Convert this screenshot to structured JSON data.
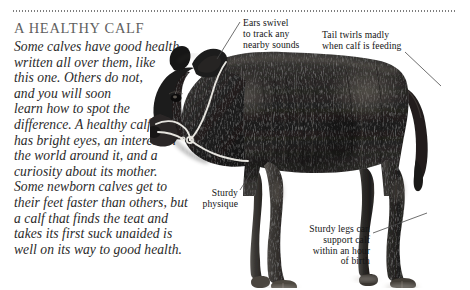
{
  "page": {
    "title": "A HEALTHY CALF",
    "body_lines": [
      "Some calves have good health",
      "written all over them, like",
      "this one. Others do not,",
      "and you will soon",
      "learn how to spot the",
      "difference. A healthy calf",
      "has bright eyes, an interest in",
      "the world around it, and a",
      "curiosity about its mother.",
      "Some newborn calves get to",
      "their feet faster than others, but",
      "a calf that finds the teat and",
      "takes its first suck unaided is",
      "well on its way to good health."
    ]
  },
  "rule": {
    "name": "dotted-divider",
    "color": "#7d7d7d"
  },
  "callouts": [
    {
      "id": "ears",
      "lines": [
        "Ears swivel",
        "to track any",
        "nearby sounds"
      ],
      "align": "left"
    },
    {
      "id": "tail",
      "lines": [
        "Tail twirls madly",
        "when calf is feeding"
      ],
      "align": "left"
    },
    {
      "id": "physique",
      "lines": [
        "Sturdy",
        "physique"
      ],
      "align": "right"
    },
    {
      "id": "legs",
      "lines": [
        "Sturdy legs can",
        "support calf",
        "within an hour",
        "of birth"
      ],
      "align": "right"
    }
  ],
  "photo": {
    "subject": "black-calf-side-view",
    "accent_halter_color": "#f2f0ea",
    "coat_color": "#232323",
    "background_color": "#ffffff"
  }
}
